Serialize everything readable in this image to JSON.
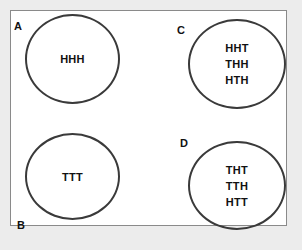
{
  "diagram": {
    "type": "sample-space-events",
    "sets": [
      {
        "label": "A",
        "outcomes": [
          "HHH"
        ]
      },
      {
        "label": "B",
        "outcomes": [
          "TTT"
        ]
      },
      {
        "label": "C",
        "outcomes": [
          "HHT",
          "THH",
          "HTH"
        ]
      },
      {
        "label": "D",
        "outcomes": [
          "THT",
          "TTH",
          "HTT"
        ]
      }
    ],
    "colors": {
      "background": "#ececec",
      "frame": "#ffffff",
      "frame_border": "#8a8a8a",
      "circle_stroke": "#3a3a3a",
      "text": "#111111"
    }
  }
}
